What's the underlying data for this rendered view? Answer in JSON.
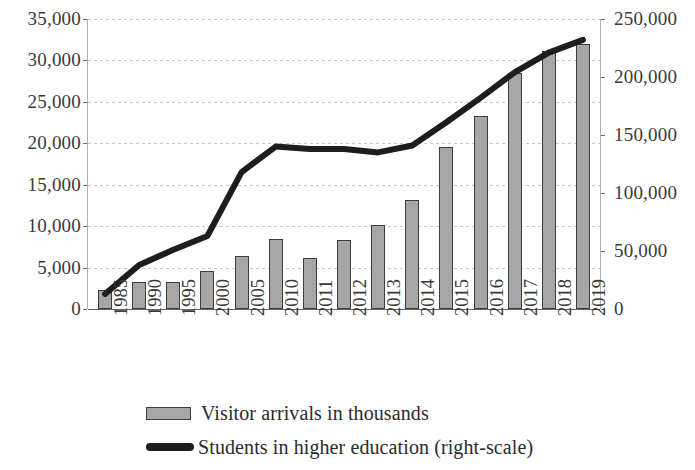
{
  "chart_data": {
    "type": "bar",
    "title": "",
    "subtitle": "",
    "xlabel": "",
    "ylabel": "",
    "grid": true,
    "legend_position": "bottom",
    "categories": [
      "1985",
      "1990",
      "1995",
      "2000",
      "2005",
      "2010",
      "2011",
      "2012",
      "2013",
      "2014",
      "2015",
      "2016",
      "2017",
      "2018",
      "2019"
    ],
    "axes": {
      "left": {
        "label": "",
        "ylim": [
          0,
          35000
        ],
        "tick_step": 5000,
        "ticks": [
          "0",
          "5,000",
          "10,000",
          "15,000",
          "20,000",
          "25,000",
          "30,000",
          "35,000"
        ],
        "tick_values": [
          0,
          5000,
          10000,
          15000,
          20000,
          25000,
          30000,
          35000
        ]
      },
      "right": {
        "label": "",
        "ylim": [
          0,
          250000
        ],
        "tick_step": 50000,
        "ticks": [
          "0",
          "50,000",
          "100,000",
          "150,000",
          "200,000",
          "250,000"
        ],
        "tick_values": [
          0,
          50000,
          100000,
          150000,
          200000,
          250000
        ]
      }
    },
    "series": [
      {
        "name": "Visitor arrivals in thousands",
        "type": "bar",
        "axis": "left",
        "color": "#a6a6a6",
        "edge_color": "#3d3d3d",
        "values": [
          2300,
          3300,
          3300,
          4600,
          6400,
          8500,
          6100,
          8300,
          10200,
          13200,
          19600,
          23300,
          28500,
          31200,
          32000
        ]
      },
      {
        "name": "Students in higher education (right-scale)",
        "type": "line",
        "axis": "right",
        "color": "#1d1d1d",
        "values": [
          13000,
          38000,
          51000,
          63000,
          118000,
          140000,
          138000,
          138000,
          135000,
          141000,
          161000,
          182000,
          204000,
          221000,
          232000
        ]
      }
    ]
  },
  "legend": {
    "items": [
      {
        "label": "Visitor arrivals in thousands",
        "marker": "bar-swatch",
        "color": "#a6a6a6"
      },
      {
        "label": "Students in higher education (right-scale)",
        "marker": "line-swatch",
        "color": "#1d1d1d"
      }
    ]
  }
}
